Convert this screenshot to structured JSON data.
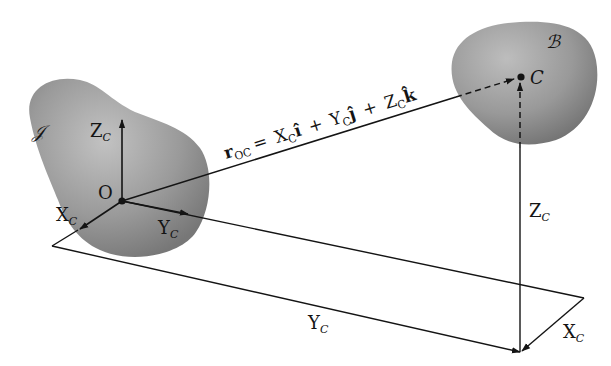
{
  "figure": {
    "type": "3D position vector diagram",
    "colors": {
      "background": "#ffffff",
      "body_fill_light": "#b5b5b5",
      "body_fill_dark": "#7a7a7a",
      "line": "#141414"
    }
  },
  "bodies": {
    "inertial": {
      "label": "𝒥"
    },
    "moving": {
      "label": "ℬ"
    }
  },
  "points": {
    "origin": {
      "label": "O"
    },
    "center": {
      "label": "C"
    }
  },
  "axes": {
    "z": {
      "main": "Z",
      "sub": "C"
    },
    "x": {
      "main": "X",
      "sub": "C"
    },
    "y": {
      "main": "Y",
      "sub": "C"
    }
  },
  "vector_equation": {
    "lhs_main": "r",
    "lhs_sub": "OC",
    "equals": "=",
    "term1_coef": "X",
    "term1_sub": "C",
    "term1_unit": "î",
    "plus1": "+",
    "term2_coef": "Y",
    "term2_sub": "C",
    "term2_unit": "ĵ",
    "plus2": "+",
    "term3_coef": "Z",
    "term3_sub": "C",
    "term3_unit": "k̂"
  },
  "components": {
    "yc": {
      "main": "Y",
      "sub": "C"
    },
    "xc": {
      "main": "X",
      "sub": "C"
    },
    "zc": {
      "main": "Z",
      "sub": "C"
    }
  }
}
